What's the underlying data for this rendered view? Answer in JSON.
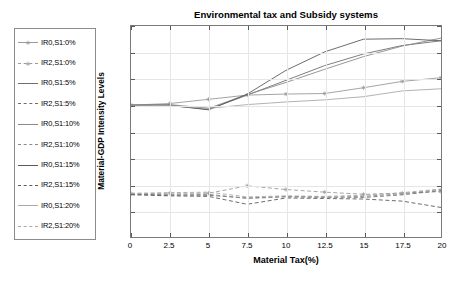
{
  "chart_data": {
    "type": "line",
    "title": "Environmental tax and Subsidy systems",
    "xlabel": "Material Tax(%)",
    "ylabel": "Material-GDP Intensity Levels",
    "xlim": [
      0,
      20
    ],
    "ylim": [
      1.25,
      1.65
    ],
    "xticks": [
      "0",
      "2.5",
      "5",
      "7.5",
      "10",
      "12.5",
      "15",
      "17.5",
      "20"
    ],
    "xtick_values": [
      0,
      2.5,
      5,
      7.5,
      10,
      12.5,
      15,
      17.5,
      20
    ],
    "yticks": [
      "1.25",
      "1.3",
      "1.35",
      "1.4",
      "1.45",
      "1.5",
      "1.55",
      "1.6",
      "1.65"
    ],
    "ytick_values": [
      1.25,
      1.3,
      1.35,
      1.4,
      1.45,
      1.5,
      1.55,
      1.6,
      1.65
    ],
    "grid": true,
    "legend_position": "outside-left",
    "x": [
      0,
      2.5,
      5,
      7.5,
      10,
      12.5,
      15,
      17.5,
      20
    ],
    "series": [
      {
        "name": "IR0,S1:0%",
        "style": "solid",
        "marker": "asterisk",
        "color": "#9a9a9a",
        "values": [
          1.5,
          1.503,
          1.511,
          1.519,
          1.521,
          1.522,
          1.533,
          1.545,
          1.552
        ]
      },
      {
        "name": "IR2,S1:0%",
        "style": "dashed",
        "marker": "asterisk",
        "color": "#9a9a9a",
        "values": [
          1.332,
          1.333,
          1.333,
          1.347,
          1.34,
          1.335,
          1.331,
          1.333,
          1.336
        ]
      },
      {
        "name": "IR0,S1:5%",
        "style": "solid",
        "marker": "none",
        "color": "#6e6e6e",
        "values": [
          1.5,
          1.499,
          1.492,
          1.519,
          1.547,
          1.575,
          1.597,
          1.613,
          1.622
        ]
      },
      {
        "name": "IR2,S1:5%",
        "style": "dashed",
        "marker": "none",
        "color": "#6e6e6e",
        "values": [
          1.331,
          1.33,
          1.329,
          1.324,
          1.327,
          1.326,
          1.325,
          1.33,
          1.338
        ]
      },
      {
        "name": "IR0,S1:10%",
        "style": "solid",
        "marker": "none",
        "color": "#8a8a8a",
        "values": [
          1.5,
          1.501,
          1.494,
          1.52,
          1.543,
          1.568,
          1.592,
          1.612,
          1.627
        ]
      },
      {
        "name": "IR2,S1:10%",
        "style": "dashed",
        "marker": "none",
        "color": "#8a8a8a",
        "values": [
          1.331,
          1.329,
          1.331,
          1.323,
          1.326,
          1.325,
          1.327,
          1.332,
          1.34
        ]
      },
      {
        "name": "IR0,S1:15%",
        "style": "solid",
        "marker": "none",
        "color": "#5a5a5a",
        "values": [
          1.5,
          1.5,
          1.491,
          1.521,
          1.566,
          1.601,
          1.625,
          1.626,
          1.622
        ]
      },
      {
        "name": "IR2,S1:15%",
        "style": "dashed",
        "marker": "none",
        "color": "#5a5a5a",
        "values": [
          1.33,
          1.328,
          1.327,
          1.312,
          1.324,
          1.323,
          1.322,
          1.318,
          1.306
        ]
      },
      {
        "name": "IR0,S1:20%",
        "style": "solid",
        "marker": "none",
        "color": "#a8a8a8",
        "values": [
          1.5,
          1.499,
          1.494,
          1.501,
          1.506,
          1.51,
          1.516,
          1.527,
          1.531
        ]
      },
      {
        "name": "IR2,S1:20%",
        "style": "dashed",
        "marker": "none",
        "color": "#a8a8a8",
        "values": [
          1.333,
          1.334,
          1.335,
          1.326,
          1.328,
          1.327,
          1.329,
          1.334,
          1.341
        ]
      }
    ]
  },
  "legend": {
    "items": [
      {
        "label": "IR0,S1:0%"
      },
      {
        "label": "IR2,S1:0%"
      },
      {
        "label": "IR0,S1:5%"
      },
      {
        "label": "IR2,S1:5%"
      },
      {
        "label": "IR0,S1:10%"
      },
      {
        "label": "IR2,S1:10%"
      },
      {
        "label": "IR0,S1:15%"
      },
      {
        "label": "IR2,S1:15%"
      },
      {
        "label": "IR0,S1:20%"
      },
      {
        "label": "IR2,S1:20%"
      }
    ]
  }
}
